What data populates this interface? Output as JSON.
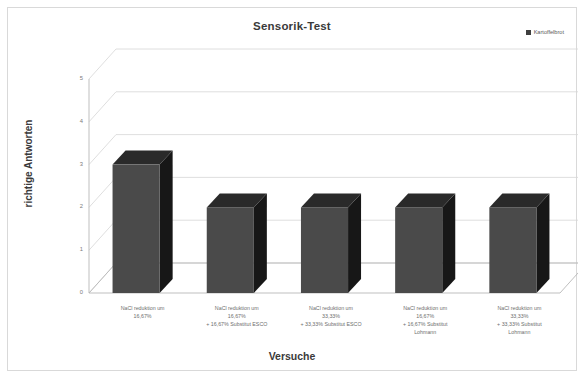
{
  "chart_data": {
    "type": "bar",
    "title": "Sensorik-Test",
    "xlabel": "Versuche",
    "ylabel": "richtige Antworten",
    "ylim": [
      0,
      5
    ],
    "yticks": [
      "0",
      "1",
      "2",
      "3",
      "4",
      "5"
    ],
    "grid": true,
    "legend_position": "top-right",
    "style": "3d-column-grayscale",
    "categories": [
      "NaCl reduktion um 16,67%",
      "NaCl reduktion um 16,67% + 16,67% Substitut ESCO",
      "NaCl reduktion um 33,33% + 33,33% Substitut ESCO",
      "NaCl reduktion um 16,67% + 16,67% Substitut Lohmann",
      "NaCl reduktion um 33,33% + 33,33% Substitut Lohmann"
    ],
    "category_lines": [
      [
        "NaCl reduktion um",
        "16,67%"
      ],
      [
        "NaCl reduktion um",
        "16,67%",
        "+ 16,67% Substitut ESCO"
      ],
      [
        "NaCl reduktion um",
        "33,33%",
        "+ 33,33% Substitut ESCO"
      ],
      [
        "NaCl reduktion um",
        "16,67%",
        "+ 16,67% Substitut",
        "Lohmann"
      ],
      [
        "NaCl reduktion um",
        "33,33%",
        "+ 33,33% Substitut",
        "Lohmann"
      ]
    ],
    "series": [
      {
        "name": "Kartoffelbrot",
        "values": [
          3,
          2,
          2,
          2,
          2
        ],
        "color": "#4a4a4a"
      }
    ],
    "colors": {
      "bar_front": "#4a4a4a",
      "bar_side": "#171717",
      "bar_top": "#2a2a2a",
      "gridline": "#d6d6d6",
      "axis": "#b8b8b8",
      "text": "#6e6e6e",
      "title_text": "#3a3a3a",
      "border": "#d9d9d9",
      "background": "#ffffff"
    }
  },
  "legend": {
    "items": [
      {
        "label": "Kartoffelbrot",
        "color": "#3f3f3f"
      }
    ]
  }
}
